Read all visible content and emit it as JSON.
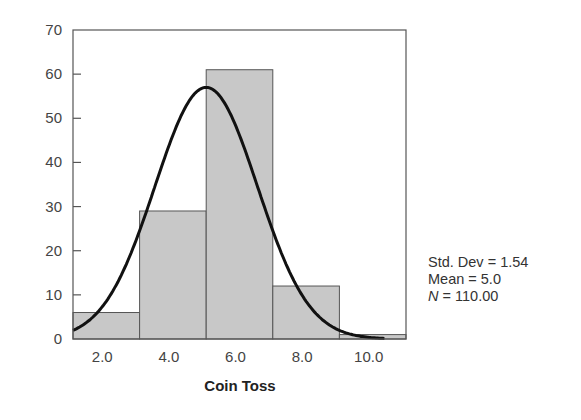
{
  "chart_data": {
    "type": "bar",
    "subtype": "histogram_with_normal_curve",
    "title": "",
    "xlabel": "Coin Toss",
    "ylabel": "",
    "ylim": [
      0,
      70
    ],
    "yticks": [
      0,
      10,
      20,
      30,
      40,
      50,
      60,
      70
    ],
    "xticks": [
      "2.0",
      "4.0",
      "6.0",
      "8.0",
      "10.0"
    ],
    "bins": [
      {
        "center": 2.0,
        "range": [
          1.0,
          3.0
        ],
        "count": 6
      },
      {
        "center": 4.0,
        "range": [
          3.0,
          5.0
        ],
        "count": 29
      },
      {
        "center": 6.0,
        "range": [
          5.0,
          7.0
        ],
        "count": 61
      },
      {
        "center": 8.0,
        "range": [
          7.0,
          9.0
        ],
        "count": 12
      },
      {
        "center": 10.0,
        "range": [
          9.0,
          11.0
        ],
        "count": 1
      }
    ],
    "categories": [
      "2.0",
      "4.0",
      "6.0",
      "8.0",
      "10.0"
    ],
    "values": [
      6,
      29,
      61,
      12,
      1
    ],
    "normal_curve": {
      "mean": 5.0,
      "std_dev": 1.54,
      "n": 110,
      "peak": 57
    },
    "grid": false,
    "bar_color": "#c8c8c8",
    "curve_color": "#111111"
  },
  "stats": {
    "std_dev_label": "Std. Dev = 1.54",
    "mean_label": "Mean = 5.0",
    "n_symbol": "N",
    "n_value": " = 110.00"
  }
}
